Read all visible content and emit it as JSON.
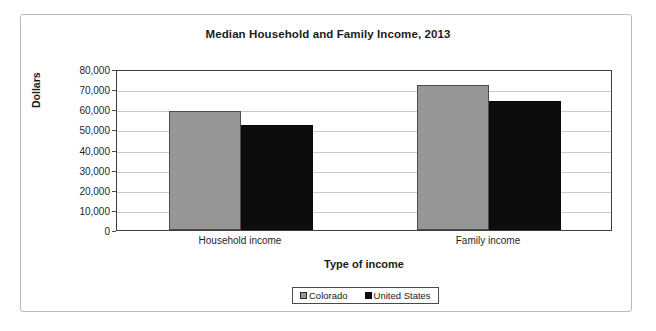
{
  "chart_data": {
    "type": "bar",
    "title": "Median Household and Family Income, 2013",
    "xlabel": "Type of income",
    "ylabel": "Dollars",
    "categories": [
      "Household income",
      "Family income"
    ],
    "series": [
      {
        "name": "Colorado",
        "values": [
          59000,
          72000
        ],
        "color": "#969696"
      },
      {
        "name": "United States",
        "values": [
          52000,
          64000
        ],
        "color": "#0d0d0d"
      }
    ],
    "ylim": [
      0,
      80000
    ],
    "ytick_values": [
      80000,
      70000,
      60000,
      50000,
      40000,
      30000,
      20000,
      10000,
      0
    ],
    "ytick_labels": [
      "80,000",
      "70,000",
      "60,000",
      "50,000",
      "40,000",
      "30,000",
      "20,000",
      "10,000",
      "0"
    ],
    "grid": true,
    "grid_axis": "y",
    "legend_position": "bottom",
    "legend_entries": [
      "Colorado",
      "United States"
    ]
  }
}
